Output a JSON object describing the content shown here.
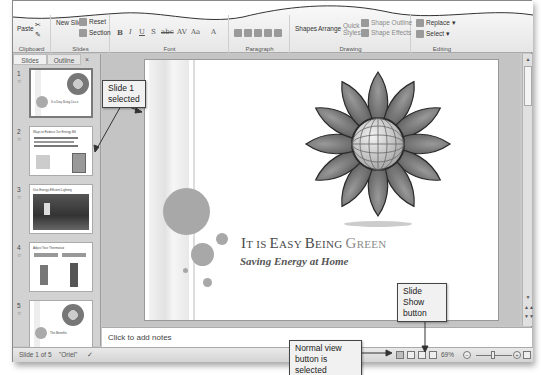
{
  "ribbon": {
    "groups": [
      {
        "label": "Clipboard",
        "items": [
          "Paste"
        ]
      },
      {
        "label": "Slides",
        "items": [
          "New Slide",
          "Reset",
          "Section"
        ]
      },
      {
        "label": "Font",
        "items": [
          "B",
          "I",
          "U",
          "S",
          "abc",
          "AV",
          "Aa",
          "A"
        ]
      },
      {
        "label": "Paragraph",
        "items": []
      },
      {
        "label": "Drawing",
        "items": [
          "Shapes",
          "Arrange",
          "Quick Styles",
          "Shape Outline",
          "Shape Effects"
        ]
      },
      {
        "label": "Editing",
        "items": [
          "Replace",
          "Select"
        ]
      }
    ]
  },
  "panel": {
    "tabs": [
      "Slides",
      "Outline"
    ],
    "close": "×",
    "thumbnails": [
      {
        "num": "1",
        "title": "It is Easy Being Green",
        "selected": true
      },
      {
        "num": "2",
        "title": "Ways to Reduce Our Energy Bill",
        "selected": false
      },
      {
        "num": "3",
        "title": "Use Energy-Efficient Lighting",
        "selected": false
      },
      {
        "num": "4",
        "title": "Adjust Your Thermostat",
        "selected": false
      },
      {
        "num": "5",
        "title": "The Benefits",
        "selected": false
      }
    ]
  },
  "slide": {
    "title_parts": [
      "I",
      "T IS ",
      "E",
      "ASY ",
      "B",
      "EING ",
      "G",
      "REEN"
    ],
    "subtitle": "Saving Energy at Home"
  },
  "notes": {
    "placeholder": "Click to add notes"
  },
  "status": {
    "slide_count": "Slide 1 of 5",
    "theme": "\"Oriel\"",
    "zoom": "69%",
    "minus": "−",
    "plus": "+"
  },
  "callouts": {
    "slide_selected": "Slide 1 selected",
    "slide_show": "Slide Show button",
    "normal_view": "Normal view button is selected"
  }
}
